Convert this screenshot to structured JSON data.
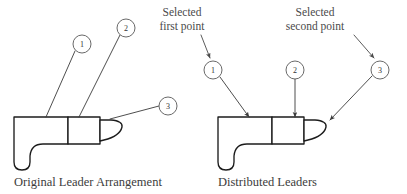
{
  "figure": {
    "background_color": "#ffffff",
    "outline_color": "#1c1c1c",
    "leader_color": "#3a3a3a",
    "text_color": "#3c3c3c"
  },
  "left_diagram": {
    "caption": "Original Leader Arrangement",
    "balloons": [
      {
        "label": "1",
        "cx": 82,
        "cy": 44,
        "r": 9
      },
      {
        "label": "2",
        "cx": 126,
        "cy": 28,
        "r": 9
      },
      {
        "label": "3",
        "cx": 168,
        "cy": 106,
        "r": 9
      }
    ],
    "leaders": [
      {
        "from": "1",
        "x1": 75,
        "y1": 51,
        "x2": 46,
        "y2": 117
      },
      {
        "from": "2",
        "x1": 120,
        "y1": 35,
        "x2": 79,
        "y2": 117
      },
      {
        "from": "3",
        "x1": 159,
        "y1": 106,
        "x2": 110,
        "y2": 119
      }
    ]
  },
  "right_diagram": {
    "caption": "Distributed Leaders",
    "balloons": [
      {
        "label": "1",
        "cx": 213,
        "cy": 70,
        "r": 9
      },
      {
        "label": "2",
        "cx": 295,
        "cy": 70,
        "r": 9
      },
      {
        "label": "3",
        "cx": 380,
        "cy": 70,
        "r": 9
      }
    ],
    "leaders": [
      {
        "from": "1",
        "x1": 220,
        "y1": 77,
        "x2": 249,
        "y2": 117
      },
      {
        "from": "2",
        "x1": 295,
        "y1": 79,
        "x2": 295,
        "y2": 117
      },
      {
        "from": "3",
        "x1": 372,
        "y1": 76,
        "x2": 330,
        "y2": 120
      }
    ],
    "annotations": [
      {
        "id": "selected-first-point",
        "line_1": "Selected",
        "line_2": "first point",
        "text_x": 182,
        "text_y_1": 16,
        "text_y_2": 30,
        "arrow": {
          "x1": 201,
          "y1": 35,
          "x2": 210,
          "y2": 58
        }
      },
      {
        "id": "selected-second-point",
        "line_1": "Selected",
        "line_2": "second point",
        "text_x": 315,
        "text_y_1": 16,
        "text_y_2": 30,
        "arrow": {
          "x1": 354,
          "y1": 35,
          "x2": 374,
          "y2": 58
        }
      }
    ]
  },
  "part_profile": {
    "description": "L-shaped machined part profile with rounded heel, stepped shank and hooked tapered nose",
    "body_path": "M 14 117 L 68 117 L 68 144 L 43 144 Q 31 144 30 156 L 30 162 Q 30 170 22 170 Q 14 170 14 162 Z",
    "shank_path": "M 68 117 L 100 117 L 100 144 L 68 144 Z",
    "nose_path": "M 100 120 L 111 120 Q 123 121 122 127 Q 120 136 104 140 L 100 141 Z"
  }
}
